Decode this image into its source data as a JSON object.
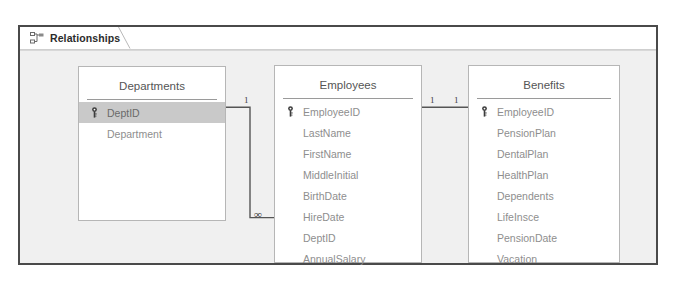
{
  "window": {
    "tab": {
      "label": "Relationships",
      "icon": "relationships-icon"
    }
  },
  "tables": [
    {
      "id": "departments",
      "name": "Departments",
      "fields": [
        {
          "name": "DeptID",
          "primary_key": true,
          "selected": true
        },
        {
          "name": "Department",
          "primary_key": false,
          "selected": false
        }
      ]
    },
    {
      "id": "employees",
      "name": "Employees",
      "fields": [
        {
          "name": "EmployeeID",
          "primary_key": true,
          "selected": false
        },
        {
          "name": "LastName",
          "primary_key": false,
          "selected": false
        },
        {
          "name": "FirstName",
          "primary_key": false,
          "selected": false
        },
        {
          "name": "MiddleInitial",
          "primary_key": false,
          "selected": false
        },
        {
          "name": "BirthDate",
          "primary_key": false,
          "selected": false
        },
        {
          "name": "HireDate",
          "primary_key": false,
          "selected": false
        },
        {
          "name": "DeptID",
          "primary_key": false,
          "selected": false
        },
        {
          "name": "AnnualSalary",
          "primary_key": false,
          "selected": false
        }
      ]
    },
    {
      "id": "benefits",
      "name": "Benefits",
      "fields": [
        {
          "name": "EmployeeID",
          "primary_key": true,
          "selected": false
        },
        {
          "name": "PensionPlan",
          "primary_key": false,
          "selected": false
        },
        {
          "name": "DentalPlan",
          "primary_key": false,
          "selected": false
        },
        {
          "name": "HealthPlan",
          "primary_key": false,
          "selected": false
        },
        {
          "name": "Dependents",
          "primary_key": false,
          "selected": false
        },
        {
          "name": "LifeInsce",
          "primary_key": false,
          "selected": false
        },
        {
          "name": "PensionDate",
          "primary_key": false,
          "selected": false
        },
        {
          "name": "Vacation",
          "primary_key": false,
          "selected": false
        }
      ]
    }
  ],
  "relationships": [
    {
      "id": "departments-employees",
      "from_table": "Departments",
      "from_field": "DeptID",
      "to_table": "Employees",
      "to_field": "DeptID",
      "from_cardinality": "1",
      "to_cardinality": "∞"
    },
    {
      "id": "employees-benefits",
      "from_table": "Employees",
      "from_field": "EmployeeID",
      "to_table": "Benefits",
      "to_field": "EmployeeID",
      "from_cardinality": "1",
      "to_cardinality": "1"
    }
  ],
  "colors": {
    "frame_border": "#4a4a4a",
    "surface": "#f0f0f0",
    "table_border": "#b6b6b6",
    "field_text": "#8e8e8e",
    "selection": "#c9c9c9",
    "connector": "#555555"
  }
}
